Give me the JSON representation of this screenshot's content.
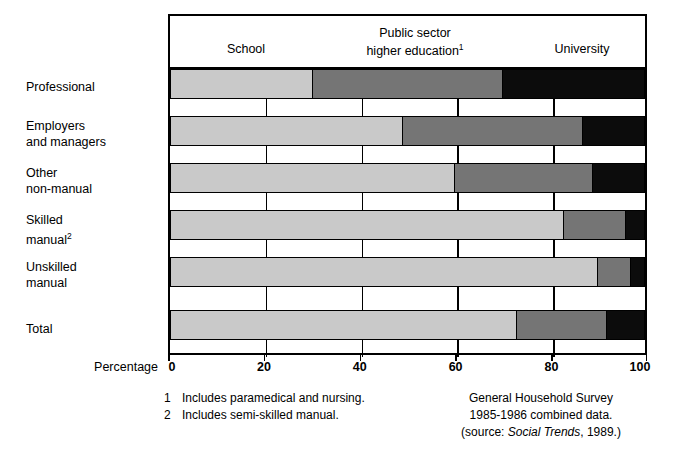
{
  "axis": {
    "title": "Percentage",
    "ticks": [
      0,
      20,
      40,
      60,
      80,
      100
    ],
    "tick_labels": [
      "0",
      "20",
      "40",
      "60",
      "80",
      "100"
    ]
  },
  "legend": {
    "school": "School",
    "public_sector_line1": "Public sector",
    "public_sector_line2": "higher education",
    "public_sector_footnote_marker": "1",
    "university": "University"
  },
  "categories": [
    {
      "line1": "Professional",
      "line2": ""
    },
    {
      "line1": "Employers",
      "line2": "and managers"
    },
    {
      "line1": "Other",
      "line2": "non-manual"
    },
    {
      "line1": "Skilled",
      "line2": "manual",
      "footnote_marker": "2"
    },
    {
      "line1": "Unskilled",
      "line2": "manual"
    },
    {
      "line1": "Total",
      "line2": ""
    }
  ],
  "footnotes": {
    "left": [
      {
        "num": "1",
        "text": "Includes paramedical and nursing."
      },
      {
        "num": "2",
        "text": "Includes semi-skilled manual."
      }
    ],
    "right": {
      "line1": "General Household Survey",
      "line2": "1985-1986 combined data.",
      "line3_prefix": "(source: ",
      "line3_italic": "Social Trends",
      "line3_suffix": ", 1989.)"
    }
  },
  "colors": {
    "school": "#c9c9c9",
    "public_sector_higher_education": "#757575",
    "university": "#0c0c0c",
    "outline": "#000000",
    "background": "#ffffff"
  },
  "chart_data": {
    "type": "bar",
    "orientation": "horizontal",
    "stacked": true,
    "stacked_normalized": true,
    "title": "",
    "xlabel": "Percentage",
    "ylabel": "",
    "xlim": [
      0,
      100
    ],
    "xticks": [
      0,
      20,
      40,
      60,
      80,
      100
    ],
    "grid": true,
    "legend_position": "top",
    "categories": [
      "Professional",
      "Employers and managers",
      "Other non-manual",
      "Skilled manual",
      "Unskilled manual",
      "Total"
    ],
    "series": [
      {
        "name": "School",
        "values": [
          30,
          49,
          60,
          83,
          90,
          73
        ]
      },
      {
        "name": "Public sector higher education",
        "values": [
          40,
          38,
          29,
          13,
          7,
          19
        ]
      },
      {
        "name": "University",
        "values": [
          30,
          13,
          11,
          4,
          3,
          8
        ]
      }
    ],
    "cumulative_boundaries": [
      [
        30,
        70
      ],
      [
        49,
        87
      ],
      [
        60,
        89
      ],
      [
        83,
        96
      ],
      [
        90,
        97
      ],
      [
        73,
        92
      ]
    ],
    "annotations": [
      "1 Includes paramedical and nursing.",
      "2 Includes semi-skilled manual.",
      "General Household Survey 1985-1986 combined data. (source: Social Trends, 1989.)"
    ]
  }
}
